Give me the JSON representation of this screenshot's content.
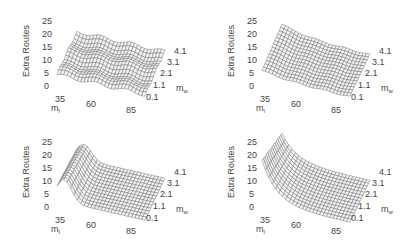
{
  "chart_data": [
    {
      "type": "surface",
      "panel": "top-left",
      "title": "",
      "zlabel": "Extra Routes",
      "xlabel": "m_l",
      "ylabel": "m_w",
      "x_ticks": [
        "35",
        "60",
        "85"
      ],
      "y_ticks": [
        "0.1",
        "1.1",
        "2.1",
        "3.1",
        "4.1"
      ],
      "z_ticks": [
        "0",
        "5",
        "10",
        "15",
        "20",
        "25"
      ],
      "zlim": [
        0,
        25
      ],
      "description": "Nearly flat, slightly wavy surface around 5-7 extra routes across all m_l and m_w",
      "approx_values": {
        "m_l_35": 6,
        "m_l_60": 6,
        "m_l_85": 6
      }
    },
    {
      "type": "surface",
      "panel": "top-right",
      "title": "",
      "zlabel": "Extra Routes",
      "xlabel": "m_l",
      "ylabel": "m_w",
      "x_ticks": [
        "35",
        "60",
        "85"
      ],
      "y_ticks": [
        "0.1",
        "1.1",
        "2.1",
        "3.1",
        "4.1"
      ],
      "z_ticks": [
        "0",
        "5",
        "10",
        "15",
        "20",
        "25"
      ],
      "zlim": [
        0,
        25
      ],
      "description": "Surface raised near low m_l (~8-10) decaying to ~5 at high m_l",
      "approx_values": {
        "m_l_35": 9,
        "m_l_60": 6,
        "m_l_85": 5
      }
    },
    {
      "type": "surface",
      "panel": "bottom-left",
      "title": "",
      "zlabel": "Extra Routes",
      "xlabel": "m_l",
      "ylabel": "m_w",
      "x_ticks": [
        "35",
        "60",
        "85"
      ],
      "y_ticks": [
        "0.1",
        "1.1",
        "2.1",
        "3.1",
        "4.1"
      ],
      "z_ticks": [
        "0",
        "5",
        "10",
        "15",
        "20",
        "25"
      ],
      "zlim": [
        0,
        25
      ],
      "description": "Ridge at low m_l (~12-15) dropping sharply to ~3-5 for higher m_l",
      "approx_values": {
        "m_l_35": 13,
        "m_l_60": 5,
        "m_l_85": 4
      }
    },
    {
      "type": "surface",
      "panel": "bottom-right",
      "title": "",
      "zlabel": "Extra Routes",
      "xlabel": "m_l",
      "ylabel": "m_w",
      "x_ticks": [
        "35",
        "60",
        "85"
      ],
      "y_ticks": [
        "0.1",
        "1.1",
        "2.1",
        "3.1",
        "4.1"
      ],
      "z_ticks": [
        "0",
        "5",
        "10",
        "15",
        "20",
        "25"
      ],
      "zlim": [
        0,
        25
      ],
      "description": "Steep peak at low m_l (~20-22) decaying rapidly to ~3 for higher m_l",
      "approx_values": {
        "m_l_35": 21,
        "m_l_60": 5,
        "m_l_85": 3
      }
    }
  ],
  "panels": [
    {
      "zlabel": "Extra Routes",
      "x_label": "m",
      "x_sub": "l",
      "y_label": "m",
      "y_sub": "w",
      "z_ticks": [
        "25",
        "20",
        "15",
        "10",
        "5",
        "0"
      ],
      "x_ticks": [
        "35",
        "60",
        "85"
      ],
      "y_ticks": [
        "0.1",
        "1.1",
        "2.1",
        "3.1",
        "4.1"
      ]
    },
    {
      "zlabel": "Extra Routes",
      "x_label": "m",
      "x_sub": "l",
      "y_label": "m",
      "y_sub": "w",
      "z_ticks": [
        "25",
        "20",
        "15",
        "10",
        "5",
        "0"
      ],
      "x_ticks": [
        "35",
        "60",
        "85"
      ],
      "y_ticks": [
        "0.1",
        "1.1",
        "2.1",
        "3.1",
        "4.1"
      ]
    },
    {
      "zlabel": "Extra Routes",
      "x_label": "m",
      "x_sub": "l",
      "y_label": "m",
      "y_sub": "w",
      "z_ticks": [
        "25",
        "20",
        "15",
        "10",
        "5",
        "0"
      ],
      "x_ticks": [
        "35",
        "60",
        "85"
      ],
      "y_ticks": [
        "0.1",
        "1.1",
        "2.1",
        "3.1",
        "4.1"
      ]
    },
    {
      "zlabel": "Extra Routes",
      "x_label": "m",
      "x_sub": "l",
      "y_label": "m",
      "y_sub": "w",
      "z_ticks": [
        "25",
        "20",
        "15",
        "10",
        "5",
        "0"
      ],
      "x_ticks": [
        "35",
        "60",
        "85"
      ],
      "y_ticks": [
        "0.1",
        "1.1",
        "2.1",
        "3.1",
        "4.1"
      ]
    }
  ],
  "style": {
    "wire_color": "#6a6a6a",
    "face_color": "#f4f4f4",
    "text_color": "#444444"
  }
}
